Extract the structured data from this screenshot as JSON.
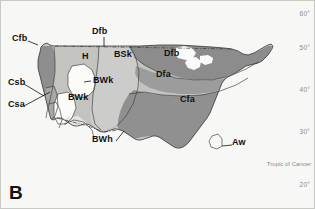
{
  "figure": {
    "panel_letter": "B",
    "width": 315,
    "height": 209,
    "background_color": "#f7f7f5",
    "frame_color": "#c9c9c4"
  },
  "latitude_axis": {
    "unit": "degrees north",
    "ticks": [
      {
        "label": "60°",
        "y": 14
      },
      {
        "label": "50°",
        "y": 48
      },
      {
        "label": "40°",
        "y": 90
      },
      {
        "label": "30°",
        "y": 132
      },
      {
        "label": "20°",
        "y": 185
      }
    ],
    "special_lines": [
      {
        "label": "Tropic of Cancer",
        "y": 164
      }
    ],
    "tick_color": "#8c8c88"
  },
  "map": {
    "region": "United States",
    "classification_system": "Köppen climate classification",
    "ocean_color": "#f2f2ef",
    "outline_color": "#3a3a3a",
    "palette": {
      "cfb_marine": "#8e8e8e",
      "csb_csa_mediterranean": "#a8a8a6",
      "highland_h": "#c3c3c0",
      "bsk_steppe": "#cccccb",
      "bwk_cold_desert": "#fbfbf8",
      "bwh_hot_desert": "#e4e4e0",
      "dfb_cold_summer": "#8c8c8c",
      "dfa_warm_summer": "#9c9c9c",
      "cfa_humid_subtropical": "#909090",
      "aw_tropical_savanna": "#7f7f7f",
      "great_lakes": "#fafaf8"
    },
    "labels": [
      {
        "code": "Cfb",
        "name": "Marine west coast",
        "x": 12,
        "y": 38,
        "leader": true
      },
      {
        "code": "Dfb",
        "name": "Humid continental, cool summer",
        "x": 92,
        "y": 30,
        "leader": true
      },
      {
        "code": "BSk",
        "name": "Cold semi-arid steppe",
        "x": 114,
        "y": 54,
        "leader": false
      },
      {
        "code": "Dfb",
        "name": "Humid continental, cool summer",
        "x": 164,
        "y": 53,
        "leader": false
      },
      {
        "code": "H",
        "name": "Highland",
        "x": 82,
        "y": 56,
        "leader": false
      },
      {
        "code": "Dfa",
        "name": "Humid continental, warm summer",
        "x": 156,
        "y": 74,
        "leader": false
      },
      {
        "code": "BWk",
        "name": "Cold desert",
        "x": 93,
        "y": 78,
        "leader": true
      },
      {
        "code": "Csb",
        "name": "Mediterranean, warm summer",
        "x": 8,
        "y": 81,
        "leader": true
      },
      {
        "code": "BWk",
        "name": "Cold desert",
        "x": 74,
        "y": 96,
        "leader": false
      },
      {
        "code": "Cfa",
        "name": "Humid subtropical",
        "x": 184,
        "y": 99,
        "leader": false
      },
      {
        "code": "Csa",
        "name": "Mediterranean, hot summer",
        "x": 8,
        "y": 103,
        "leader": true
      },
      {
        "code": "BWh",
        "name": "Hot desert",
        "x": 97,
        "y": 138,
        "leader": true
      },
      {
        "code": "Aw",
        "name": "Tropical savanna",
        "x": 233,
        "y": 142,
        "leader": true
      }
    ]
  }
}
